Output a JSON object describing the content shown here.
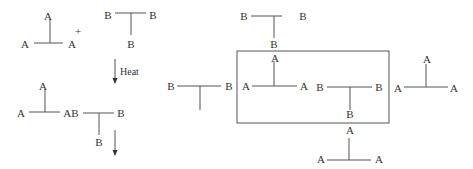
{
  "diagram": {
    "type": "monomer polymerization scheme",
    "line_color": "#555555",
    "text_color": "#333333",
    "reactants": {
      "a3_monomer": {
        "top": "A",
        "left": "A",
        "right": "A"
      },
      "plus": "+",
      "b3_monomer": {
        "left": "B",
        "right": "B",
        "bottom": "B"
      }
    },
    "arrow_label": "Heat",
    "product": {
      "a_top": "A",
      "a_left": "A",
      "link": "AB",
      "b_right": "B",
      "b_bottom": "B"
    },
    "network": {
      "top_b3": {
        "left": "B",
        "right": "B",
        "bottom": "B"
      },
      "left_b3": {
        "left": "B",
        "right": "B"
      },
      "boxed_a3": {
        "top": "A",
        "left": "A",
        "right": "A"
      },
      "boxed_b3": {
        "left": "B",
        "right": "B",
        "bottom": "B"
      },
      "right_a3": {
        "top": "A",
        "left": "A",
        "right": "A"
      },
      "bottom_a3": {
        "top": "A",
        "left": "A",
        "right": "A"
      }
    }
  }
}
